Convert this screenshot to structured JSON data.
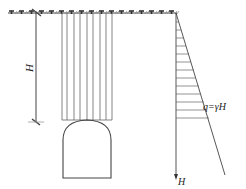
{
  "diagram": {
    "title": "",
    "labels": {
      "depth_dimension": "H",
      "load_formula": "q=γH",
      "depth_axis": "H"
    },
    "elements": {
      "ground_surface": {
        "y": 13,
        "x_start": 8,
        "x_end": 176,
        "symbol": "ground-hatch"
      },
      "depth_dimension_line": {
        "x": 36,
        "y_top": 13,
        "y_bottom": 122
      },
      "overburden_columns": {
        "count": 8,
        "x_start": 62,
        "x_end": 112,
        "y_top": 13,
        "y_bottom": 120
      },
      "tunnel": {
        "shape": "horseshoe",
        "x_left": 62,
        "x_right": 112,
        "y_crown": 120,
        "y_springline": 138,
        "y_invert": 178
      },
      "pressure_diagram": {
        "shape": "triangle",
        "axis_x": 176,
        "y_top": 13,
        "y_arrow": 178,
        "slope_end_x": 225,
        "slope_end_y": 175,
        "hatch_count": 12
      }
    },
    "colors": {
      "line": "#444444",
      "light_line": "#777777",
      "text": "#222222",
      "background": "#ffffff"
    }
  }
}
